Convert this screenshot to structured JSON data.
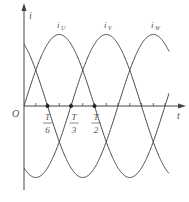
{
  "chart_data": {
    "type": "line",
    "title": "",
    "xlabel": "t",
    "ylabel": "i",
    "origin_label": "O",
    "series": [
      {
        "name": "i_U",
        "label_main": "i",
        "label_sub": "U",
        "phase_deg": 0,
        "label_x": 60
      },
      {
        "name": "i_V",
        "label_main": "i",
        "label_sub": "V",
        "phase_deg": -120,
        "label_x": 107
      },
      {
        "name": "i_W",
        "label_main": "i",
        "label_sub": "W",
        "phase_deg": 120,
        "label_x": 154
      }
    ],
    "function": "sin(2*pi*t/T + phase)",
    "x_range_periods": [
      0,
      1.03
    ],
    "marked_points": [
      {
        "num": "T",
        "den": "6",
        "t_fraction": 0.16667
      },
      {
        "num": "T",
        "den": "3",
        "t_fraction": 0.33333
      },
      {
        "num": "T",
        "den": "2",
        "t_fraction": 0.5
      }
    ],
    "tick_count": 12,
    "grid": false
  },
  "colors": {
    "curve": "#444444",
    "axis": "#444444",
    "text": "#555555"
  }
}
